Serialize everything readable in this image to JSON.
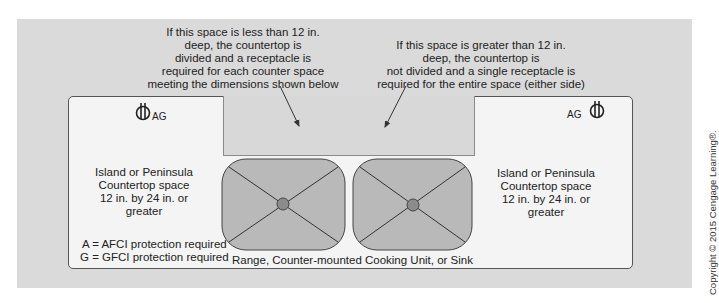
{
  "callouts": {
    "left": {
      "lines": [
        "If this space is less than 12 in.",
        "deep, the countertop is",
        "divided and a receptacle is",
        "required for each counter space",
        "meeting the dimensions shown below"
      ]
    },
    "right": {
      "lines": [
        "If this space is greater than 12 in.",
        "deep, the countertop is",
        "not divided and a single receptacle is",
        "required for the entire space (either side)"
      ]
    }
  },
  "receptacles": {
    "left": {
      "label": "AG",
      "icon": "receptacle-outlet-icon"
    },
    "right": {
      "label": "AG",
      "icon": "receptacle-outlet-icon"
    }
  },
  "countertop_left": {
    "lines": [
      "Island or Peninsula",
      "Countertop space",
      "12 in. by 24 in. or",
      "greater"
    ]
  },
  "countertop_right": {
    "lines": [
      "Island or Peninsula",
      "Countertop space",
      "12 in. by 24 in. or",
      "greater"
    ]
  },
  "legend": {
    "lines": [
      "A = AFCI protection required",
      "G = GFCI protection required"
    ]
  },
  "appliance_caption": "Range, Counter-mounted Cooking Unit, or Sink",
  "copyright": "Copyright © 2015 Cengage Learning®.",
  "colors": {
    "outer_background": "#dadada",
    "island_fill": "#f4f4f4",
    "middle_space_fill": "#d8d8d8",
    "burner_fill": "#b9b9b9",
    "burner_center": "#8c8c8c",
    "line": "#333333"
  }
}
